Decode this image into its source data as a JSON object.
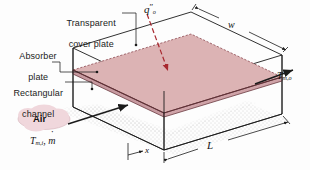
{
  "figure": {
    "background_color": "#fdfdfd",
    "line_color": "#1b1b1b",
    "absorber_color": "#dcb3b4",
    "cover_color": "#ffffff",
    "flux_arrow_color": "#a8282f",
    "air_cloud_color": "#f0d7dc"
  },
  "callouts": {
    "cover_plate": "Transparent\ncover plate",
    "cover_plate_line1": "Transparent",
    "cover_plate_line2": "cover plate",
    "absorber_plate_line1": "Absorber",
    "absorber_plate_line2": "plate",
    "channel_line1": "Rectangular",
    "channel_line2": "channel",
    "air": "Air"
  },
  "symbols": {
    "heat_flux": "q″ₒ",
    "heat_flux_base": "q",
    "heat_flux_prime": "″",
    "heat_flux_sub": "o",
    "width": "w",
    "length": "L",
    "axis_x": "x",
    "temp_out_base": "T",
    "temp_out_sub": "m,o",
    "temp_in_base": "T",
    "temp_in_sub": "m,i",
    "mass_flow": "ṁ",
    "mass_flow_base": "m"
  },
  "geometry": {
    "cover_top": [
      [
        73,
        48
      ],
      [
        191,
        12
      ],
      [
        282,
        55
      ],
      [
        164,
        91
      ]
    ],
    "absorber": [
      [
        73,
        70
      ],
      [
        191,
        34
      ],
      [
        282,
        77
      ],
      [
        164,
        113
      ]
    ],
    "box_bottom_front_left": [
      73,
      107
    ],
    "box_bottom_front_right": [
      164,
      150
    ],
    "box_bottom_back_right": [
      282,
      114
    ]
  },
  "dimensions": {
    "w_label": "w",
    "L_label": "L",
    "x_label": "x"
  }
}
